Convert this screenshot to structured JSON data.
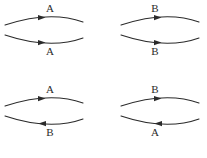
{
  "figure": {
    "background_color": "#ffffff",
    "stroke_color": "#2b2b2b",
    "layout": "2x2 grid",
    "cells": [
      {
        "id": "top-left",
        "position": "top-left",
        "top_arc": {
          "label": "A",
          "label_position": "above",
          "direction": "right",
          "arrow_marker": "arrowhead-right",
          "curvature": "bulge-up"
        },
        "bottom_arc": {
          "label": "A",
          "label_position": "below",
          "direction": "right",
          "arrow_marker": "arrowhead-right",
          "curvature": "bulge-down"
        }
      },
      {
        "id": "top-right",
        "position": "top-right",
        "top_arc": {
          "label": "B",
          "label_position": "above",
          "direction": "right",
          "arrow_marker": "arrowhead-right",
          "curvature": "bulge-up"
        },
        "bottom_arc": {
          "label": "B",
          "label_position": "below",
          "direction": "right",
          "arrow_marker": "arrowhead-right",
          "curvature": "bulge-down"
        }
      },
      {
        "id": "bottom-left",
        "position": "bottom-left",
        "top_arc": {
          "label": "A",
          "label_position": "above",
          "direction": "right",
          "arrow_marker": "arrowhead-right",
          "curvature": "bulge-up"
        },
        "bottom_arc": {
          "label": "B",
          "label_position": "below",
          "direction": "left",
          "arrow_marker": "arrowhead-left",
          "curvature": "bulge-down"
        }
      },
      {
        "id": "bottom-right",
        "position": "bottom-right",
        "top_arc": {
          "label": "B",
          "label_position": "above",
          "direction": "right",
          "arrow_marker": "arrowhead-right",
          "curvature": "bulge-up"
        },
        "bottom_arc": {
          "label": "A",
          "label_position": "below",
          "direction": "left",
          "arrow_marker": "arrowhead-left",
          "curvature": "bulge-down"
        }
      }
    ]
  }
}
